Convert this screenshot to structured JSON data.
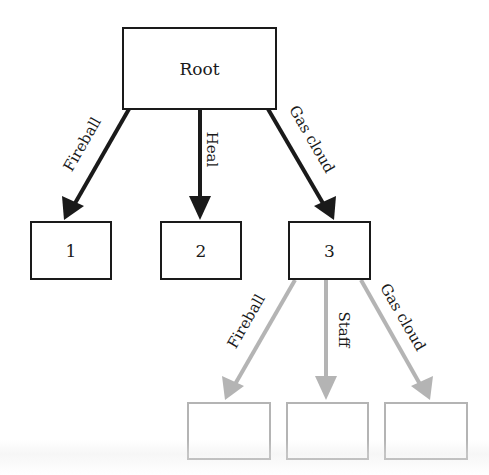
{
  "diagram": {
    "type": "decision-tree",
    "colors": {
      "primary": "#1a1a1a",
      "faded": "#b4b4b4",
      "background": "#ffffff"
    },
    "root": {
      "label": "Root"
    },
    "level1": {
      "edges": [
        {
          "label": "Fireball",
          "target": "1"
        },
        {
          "label": "Heal",
          "target": "2"
        },
        {
          "label": "Gas cloud",
          "target": "3"
        }
      ],
      "nodes": [
        {
          "label": "1"
        },
        {
          "label": "2"
        },
        {
          "label": "3"
        }
      ]
    },
    "level2": {
      "parent": "3",
      "edges": [
        {
          "label": "Fireball"
        },
        {
          "label": "Staff"
        },
        {
          "label": "Gas cloud"
        }
      ],
      "nodes": [
        {
          "label": ""
        },
        {
          "label": ""
        },
        {
          "label": ""
        }
      ]
    }
  }
}
